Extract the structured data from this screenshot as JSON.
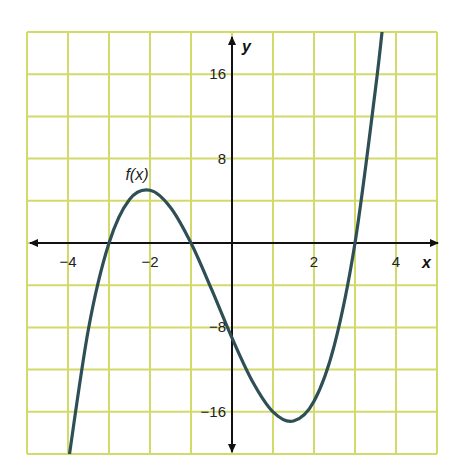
{
  "chart_data": {
    "type": "line",
    "title": "",
    "xlabel": "x",
    "ylabel": "y",
    "xlim": [
      -5,
      5
    ],
    "ylim": [
      -20,
      20
    ],
    "grid": true,
    "x_grid_step": 1,
    "y_grid_step": 4,
    "x_tick_labels": [
      {
        "value": -4,
        "label": "−4"
      },
      {
        "value": -2,
        "label": "−2"
      },
      {
        "value": 2,
        "label": "2"
      },
      {
        "value": 4,
        "label": "4"
      }
    ],
    "y_tick_labels": [
      {
        "value": 16,
        "label": "16"
      },
      {
        "value": 8,
        "label": "8"
      },
      {
        "value": -8,
        "label": "−8"
      },
      {
        "value": -16,
        "label": "−16"
      }
    ],
    "series": [
      {
        "name": "f(x)",
        "label": "f(x)",
        "label_position": {
          "x": -2.6,
          "y": 6.5
        },
        "x": [
          -4,
          -3.5,
          -3,
          -2.5,
          -2,
          -1.5,
          -1,
          -0.5,
          0,
          0.5,
          1,
          1.5,
          2,
          2.5,
          3,
          3.5,
          3.7
        ],
        "y": [
          -21,
          -8.125,
          0,
          4.125,
          5,
          3.375,
          0,
          -4.375,
          -9,
          -13.125,
          -16,
          -16.875,
          -15,
          -9.625,
          0,
          14.625,
          21.5
        ],
        "key_points": {
          "roots": [
            -3,
            -1,
            3
          ],
          "local_max": {
            "x": -2.1,
            "y": 5.0
          },
          "local_min": {
            "x": 1.4,
            "y": -16.9
          },
          "y_intercept": -9
        }
      }
    ],
    "legend": "none (inline label f(x) near local max)"
  },
  "labels": {
    "x_axis": "x",
    "y_axis": "y",
    "function": "f(x)",
    "ticks_x": [
      "−4",
      "−2",
      "2",
      "4"
    ],
    "ticks_y": [
      "16",
      "8",
      "−8",
      "−16"
    ]
  },
  "colors": {
    "grid": "#d2da6a",
    "curve": "#2f4f56",
    "axes": "#111111",
    "background": "#ffffff"
  }
}
